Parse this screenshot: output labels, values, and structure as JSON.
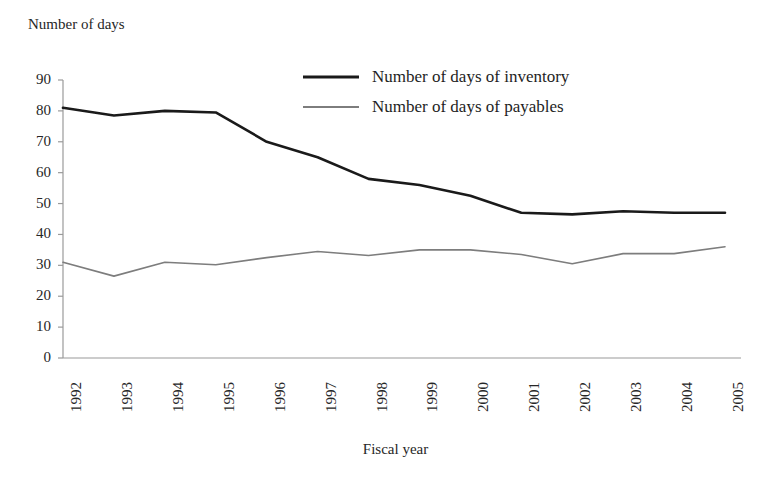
{
  "chart_data": {
    "type": "line",
    "title": "",
    "xlabel": "Fiscal year",
    "ylabel": "Number of days",
    "categories": [
      "1992",
      "1993",
      "1994",
      "1995",
      "1996",
      "1997",
      "1998",
      "1999",
      "2000",
      "2001",
      "2002",
      "2003",
      "2004",
      "2005"
    ],
    "x": [
      1992,
      1993,
      1994,
      1995,
      1996,
      1997,
      1998,
      1999,
      2000,
      2001,
      2002,
      2003,
      2004,
      2005
    ],
    "ylim": [
      0,
      90
    ],
    "yticks": [
      0,
      10,
      20,
      30,
      40,
      50,
      60,
      70,
      80,
      90
    ],
    "grid": false,
    "legend_position": "top-center",
    "series": [
      {
        "name": "Number of days of inventory",
        "color": "#1a1a1a",
        "width": 2.6,
        "values": [
          81,
          78.5,
          80,
          79.5,
          70,
          65,
          58,
          56,
          52.5,
          47,
          46.5,
          47.5,
          47,
          47
        ]
      },
      {
        "name": "Number of days of payables",
        "color": "#7d7d7d",
        "width": 1.6,
        "values": [
          31,
          26.5,
          31,
          30.2,
          32.5,
          34.5,
          33.2,
          35,
          35,
          33.5,
          30.5,
          33.8,
          33.8,
          36
        ]
      }
    ]
  },
  "axes": {
    "ylabel_title": "Number of days",
    "xlabel_title": "Fiscal year"
  },
  "legend": {
    "items": [
      {
        "label": "Number of days of inventory"
      },
      {
        "label": "Number of days of payables"
      }
    ]
  }
}
